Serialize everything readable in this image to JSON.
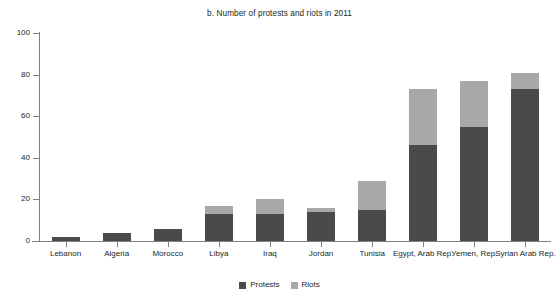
{
  "chart_data": {
    "type": "bar",
    "subtype": "stacked-vertical",
    "title": "b. Number of protests and riots in 2011",
    "xlabel": "",
    "ylabel": "",
    "ylim": [
      0,
      100
    ],
    "yticks": [
      0,
      20,
      40,
      60,
      80,
      100
    ],
    "grid": false,
    "legend_position": "bottom-center",
    "categories": [
      "Lebanon",
      "Algeria",
      "Morocco",
      "Libya",
      "Iraq",
      "Jordan",
      "Tunisia",
      "Egypt, Arab Rep.",
      "Yemen, Rep.",
      "Syrian Arab Rep."
    ],
    "series": [
      {
        "name": "Protests",
        "color": "#4a4a4a",
        "values": [
          2,
          4,
          6,
          13,
          13,
          14,
          15,
          46,
          55,
          73
        ]
      },
      {
        "name": "Riots",
        "color": "#a8a8a8",
        "values": [
          0,
          0,
          0,
          4,
          7,
          2,
          14,
          27,
          22,
          8
        ]
      }
    ],
    "totals": [
      2,
      4,
      6,
      17,
      20,
      16,
      29,
      73,
      77,
      81
    ]
  },
  "legend": {
    "items": [
      {
        "label": "Protests",
        "color": "#4a4a4a"
      },
      {
        "label": "Riots",
        "color": "#a8a8a8"
      }
    ]
  }
}
